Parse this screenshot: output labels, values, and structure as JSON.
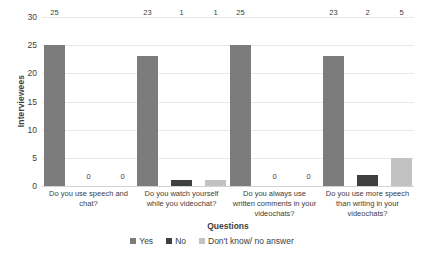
{
  "chart_data": {
    "type": "bar",
    "title": "",
    "xlabel": "Questions",
    "ylabel": "Interviewees",
    "ylim": [
      0,
      30
    ],
    "yticks": [
      0,
      5,
      10,
      15,
      20,
      25,
      30
    ],
    "grid": true,
    "legend_position": "bottom",
    "categories": [
      "Do you use speech and chat?",
      "Do you watch yourself while you videochat?",
      "Do you always use written comments in your videochats?",
      "Do you use more speech than writing in your videochats?"
    ],
    "series": [
      {
        "name": "Yes",
        "color": "#7c7c7c",
        "values": [
          25,
          23,
          25,
          23
        ]
      },
      {
        "name": "No",
        "color": "#3f3f3f",
        "values": [
          0,
          1,
          0,
          2
        ]
      },
      {
        "name": "Don't know/ no answer",
        "color": "#c2c2c2",
        "values": [
          0,
          1,
          0,
          5
        ]
      }
    ]
  }
}
